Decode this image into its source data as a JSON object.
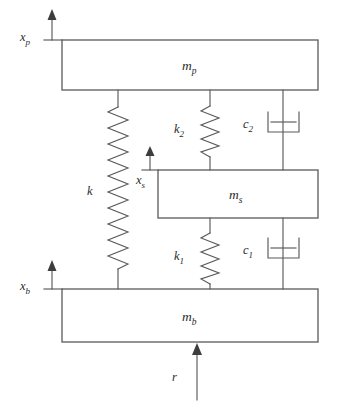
{
  "diagram": {
    "colors": {
      "line": "#5a5a5a",
      "text": "#2b2b2b",
      "background": "#ffffff",
      "arrow": "#3d3d3d"
    },
    "masses": [
      {
        "id": "mp",
        "symbol": "m",
        "subscript": "p",
        "label": "mp"
      },
      {
        "id": "ms",
        "symbol": "m",
        "subscript": "s",
        "label": "ms"
      },
      {
        "id": "mb",
        "symbol": "m",
        "subscript": "b",
        "label": "mb"
      }
    ],
    "springs": [
      {
        "id": "k",
        "symbol": "k",
        "subscript": "",
        "label": "k"
      },
      {
        "id": "k2",
        "symbol": "k",
        "subscript": "2",
        "label": "k2"
      },
      {
        "id": "k1",
        "symbol": "k",
        "subscript": "1",
        "label": "k1"
      }
    ],
    "dampers": [
      {
        "id": "c2",
        "symbol": "c",
        "subscript": "2",
        "label": "c2"
      },
      {
        "id": "c1",
        "symbol": "c",
        "subscript": "1",
        "label": "c1"
      }
    ],
    "coordinates": [
      {
        "id": "xp",
        "symbol": "x",
        "subscript": "p",
        "label": "xp",
        "direction": "up"
      },
      {
        "id": "xs",
        "symbol": "x",
        "subscript": "s",
        "label": "xs",
        "direction": "up"
      },
      {
        "id": "xb",
        "symbol": "x",
        "subscript": "b",
        "label": "xb",
        "direction": "up"
      }
    ],
    "inputs": [
      {
        "id": "r",
        "symbol": "r",
        "subscript": "",
        "label": "r",
        "direction": "up"
      }
    ]
  }
}
